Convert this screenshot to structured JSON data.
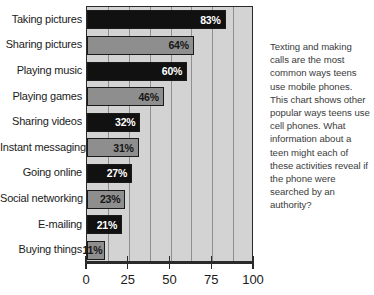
{
  "chart_data": {
    "type": "bar",
    "orientation": "horizontal",
    "title": "",
    "xlabel": "",
    "ylabel": "",
    "xlim": [
      0,
      100
    ],
    "grid": true,
    "legend": false,
    "xticks": [
      "0",
      "25",
      "50",
      "75",
      "100"
    ],
    "xtick_values": [
      0,
      25,
      50,
      75,
      100
    ],
    "minor_gridlines": [
      12.5,
      25,
      37.5,
      50,
      62.5,
      75,
      87.5
    ],
    "categories": [
      "Taking pictures",
      "Sharing pictures",
      "Playing music",
      "Playing games",
      "Sharing videos",
      "Instant messaging",
      "Going online",
      "Social networking",
      "E-mailing",
      "Buying things"
    ],
    "values": [
      83,
      64,
      60,
      46,
      32,
      31,
      27,
      23,
      21,
      11
    ],
    "value_labels": [
      "83%",
      "64%",
      "60%",
      "46%",
      "32%",
      "31%",
      "27%",
      "23%",
      "21%",
      "11%"
    ],
    "bar_styles": [
      "dark",
      "light",
      "dark",
      "light",
      "dark",
      "light",
      "dark",
      "light",
      "dark",
      "light"
    ],
    "colors": {
      "bar_dark": "#111111",
      "bar_light": "#8e8e8e",
      "plot_background": "#d3d3d3",
      "gridline": "#8f8f8f",
      "axis": "#2a2a2a",
      "label_text": "#1b1b1b",
      "caption_text": "#3b3b3b"
    }
  },
  "caption": {
    "text": "Texting and making calls are the most common ways teens use mobile phones. This chart shows other popular ways teens use cell phones. What information about a teen might each of these activities reveal if the phone were searched by an authority?"
  }
}
